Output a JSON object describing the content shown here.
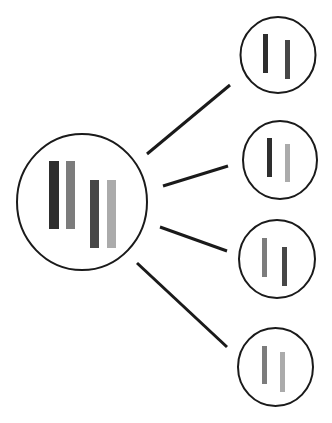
{
  "diagram": {
    "colors": {
      "outline": "#1a1a1a",
      "dark": "#2e2e2e",
      "dark2": "#474747",
      "mid": "#7c7c7c",
      "light": "#ababab",
      "background": "#ffffff"
    },
    "parent": {
      "cx": 82,
      "cy": 202,
      "rx": 65,
      "ry": 68,
      "bars": [
        {
          "x": 49,
          "y": 161,
          "w": 10,
          "h": 68,
          "color": "#2e2e2e"
        },
        {
          "x": 66,
          "y": 161,
          "w": 9,
          "h": 68,
          "color": "#7c7c7c"
        },
        {
          "x": 90,
          "y": 180,
          "w": 9,
          "h": 68,
          "color": "#474747"
        },
        {
          "x": 107,
          "y": 180,
          "w": 9,
          "h": 68,
          "color": "#ababab"
        }
      ]
    },
    "gametes": [
      {
        "cx": 278,
        "cy": 55,
        "rx": 37.5,
        "ry": 38,
        "bars": [
          {
            "x": 263,
            "y": 34,
            "w": 5,
            "h": 39,
            "color": "#2e2e2e"
          },
          {
            "x": 285,
            "y": 40,
            "w": 5,
            "h": 39,
            "color": "#474747"
          }
        ],
        "line": {
          "x1": 147,
          "y1": 154,
          "x2": 230,
          "y2": 85
        }
      },
      {
        "cx": 280,
        "cy": 160,
        "rx": 37,
        "ry": 39,
        "bars": [
          {
            "x": 267,
            "y": 138,
            "w": 5,
            "h": 39,
            "color": "#2e2e2e"
          },
          {
            "x": 285,
            "y": 144,
            "w": 5,
            "h": 38,
            "color": "#ababab"
          }
        ],
        "line": {
          "x1": 163,
          "y1": 186,
          "x2": 228,
          "y2": 166
        }
      },
      {
        "cx": 277,
        "cy": 259,
        "rx": 38,
        "ry": 39,
        "bars": [
          {
            "x": 262,
            "y": 238,
            "w": 5,
            "h": 39,
            "color": "#7c7c7c"
          },
          {
            "x": 282,
            "y": 247,
            "w": 5,
            "h": 39,
            "color": "#474747"
          }
        ],
        "line": {
          "x1": 160,
          "y1": 227,
          "x2": 227,
          "y2": 251
        }
      },
      {
        "cx": 275.5,
        "cy": 367,
        "rx": 37.5,
        "ry": 39,
        "bars": [
          {
            "x": 262,
            "y": 346,
            "w": 5,
            "h": 38,
            "color": "#7c7c7c"
          },
          {
            "x": 280,
            "y": 352,
            "w": 5,
            "h": 40,
            "color": "#ababab"
          }
        ],
        "line": {
          "x1": 137,
          "y1": 263,
          "x2": 227,
          "y2": 347
        }
      }
    ]
  }
}
